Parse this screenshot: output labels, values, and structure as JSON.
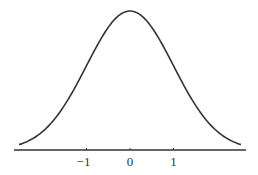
{
  "chart_data": {
    "type": "line",
    "title": "",
    "xlabel": "",
    "ylabel": "",
    "function": "normal_pdf",
    "mean": 0,
    "std": 1,
    "xlim": [
      -2.67,
      2.67
    ],
    "ylim": [
      0,
      0.4
    ],
    "x_ticks": [
      -1,
      0,
      1
    ],
    "x_tick_labels": [
      "−1",
      "0",
      "1"
    ],
    "y_axis_visible": false,
    "grid": false,
    "legend": null,
    "series": [
      {
        "name": "density",
        "x": [
          -2.6,
          -2.4,
          -2.2,
          -2.0,
          -1.8,
          -1.6,
          -1.4,
          -1.2,
          -1.0,
          -0.8,
          -0.6,
          -0.4,
          -0.2,
          0.0,
          0.2,
          0.4,
          0.6,
          0.8,
          1.0,
          1.2,
          1.4,
          1.6,
          1.8,
          2.0,
          2.2,
          2.4,
          2.6
        ],
        "values": [
          0.0136,
          0.0224,
          0.0355,
          0.054,
          0.079,
          0.1109,
          0.1497,
          0.1942,
          0.242,
          0.2897,
          0.3332,
          0.3683,
          0.391,
          0.3989,
          0.391,
          0.3683,
          0.3332,
          0.2897,
          0.242,
          0.1942,
          0.1497,
          0.1109,
          0.079,
          0.054,
          0.0355,
          0.0224,
          0.0136
        ]
      }
    ],
    "colors": {
      "curve": "#333333",
      "axis": "#333333",
      "background": "#ffffff"
    }
  }
}
